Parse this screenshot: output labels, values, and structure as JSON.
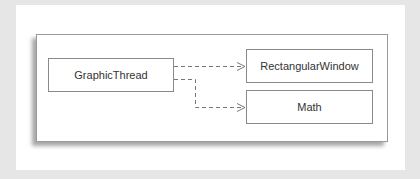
{
  "diagram": {
    "type": "dependency-diagram",
    "nodes": [
      {
        "id": "graphic_thread",
        "label": "GraphicThread"
      },
      {
        "id": "rectangular_window",
        "label": "RectangularWindow"
      },
      {
        "id": "math",
        "label": "Math"
      }
    ],
    "edges": [
      {
        "from": "GraphicThread",
        "to": "RectangularWindow",
        "style": "dashed",
        "arrow": "open"
      },
      {
        "from": "GraphicThread",
        "to": "Math",
        "style": "dashed",
        "arrow": "open"
      }
    ],
    "colors": {
      "background": "#e6e6e6",
      "card": "#ffffff",
      "border": "#8a8a8a",
      "edge": "#777777",
      "text": "#333333"
    }
  }
}
